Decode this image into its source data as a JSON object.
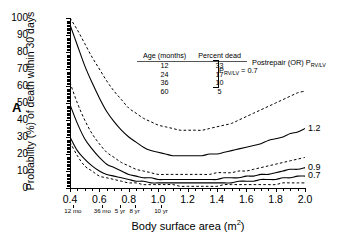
{
  "panel": {
    "letter": "A"
  },
  "axes": {
    "ylabel": "Probability (%) of death within 30 days",
    "xlabel_text": "Body surface area (m",
    "xlabel_sup": "2",
    "xlabel_tail": ")"
  },
  "legend": {
    "col1_header": "Age (months)",
    "col2_header": "Percent dead",
    "rows": [
      {
        "age": "12",
        "dead": "33"
      },
      {
        "age": "24",
        "dead": "17"
      },
      {
        "age": "36",
        "dead": "10"
      },
      {
        "age": "60",
        "dead": "5"
      }
    ],
    "brace_label_main": "P",
    "brace_label_sub": "RV/LV",
    "brace_label_value": " = 0.7",
    "postrepair_main": "Postrepair (OR) P",
    "postrepair_sub": "RV/LV"
  },
  "curve_labels": [
    {
      "text": "1.2"
    },
    {
      "text": "0.9"
    },
    {
      "text": "0.7"
    }
  ],
  "age_ticks": [
    {
      "label": "12 mo",
      "x": 0.42
    },
    {
      "label": "36 mo",
      "x": 0.62
    },
    {
      "label": "5 yr",
      "x": 0.74
    },
    {
      "label": "8 yr",
      "x": 0.84
    },
    {
      "label": "10 yr",
      "x": 1.02
    }
  ],
  "chart_data": {
    "type": "line",
    "title": "",
    "xlabel": "Body surface area (m2)",
    "ylabel": "Probability (%) of death within 30 days",
    "xlim": [
      0.4,
      2.0
    ],
    "ylim": [
      0,
      100
    ],
    "xticks": [
      0.4,
      0.6,
      0.8,
      1.0,
      1.2,
      1.4,
      1.6,
      1.8,
      2.0
    ],
    "yticks": [
      0,
      10,
      20,
      30,
      40,
      50,
      60,
      70,
      80,
      90,
      100
    ],
    "grid": false,
    "legend_position": "inside-top-center",
    "x": [
      0.4,
      0.45,
      0.5,
      0.55,
      0.6,
      0.65,
      0.7,
      0.75,
      0.8,
      0.85,
      0.9,
      0.95,
      1.0,
      1.05,
      1.1,
      1.15,
      1.2,
      1.25,
      1.3,
      1.35,
      1.4,
      1.45,
      1.5,
      1.55,
      1.6,
      1.65,
      1.7,
      1.75,
      1.8,
      1.85,
      1.9,
      1.95,
      2.0
    ],
    "series": [
      {
        "name": "PRV/LV 1.2 dashed",
        "style": "dashed",
        "end_label": "",
        "values": [
          100,
          93,
          85,
          77,
          70,
          63,
          57,
          52,
          47,
          44,
          41,
          39,
          37,
          36,
          35,
          34,
          34,
          34,
          34,
          35,
          36,
          37,
          38,
          40,
          42,
          44,
          46,
          48,
          50,
          52,
          54,
          56,
          57
        ]
      },
      {
        "name": "PRV/LV 1.2 solid",
        "style": "solid",
        "end_label": "1.2",
        "values": [
          96,
          84,
          72,
          62,
          53,
          45,
          39,
          34,
          30,
          27,
          24,
          22,
          21,
          20,
          19,
          19,
          19,
          19,
          19,
          20,
          20,
          21,
          22,
          23,
          24,
          25,
          26,
          28,
          29,
          30,
          32,
          33,
          35
        ]
      },
      {
        "name": "PRV/LV 0.9 dashed",
        "style": "dashed",
        "end_label": "",
        "values": [
          62,
          50,
          40,
          32,
          26,
          21,
          18,
          15,
          13,
          11,
          10,
          9,
          8,
          8,
          8,
          8,
          8,
          8,
          8,
          8,
          9,
          9,
          9,
          10,
          10,
          11,
          12,
          13,
          14,
          15,
          16,
          17,
          18
        ]
      },
      {
        "name": "PRV/LV 0.9 solid",
        "style": "solid",
        "end_label": "0.9",
        "values": [
          49,
          38,
          29,
          23,
          18,
          14,
          12,
          10,
          8,
          7,
          6,
          6,
          5,
          5,
          5,
          5,
          5,
          5,
          5,
          5,
          5,
          6,
          6,
          6,
          7,
          7,
          8,
          8,
          9,
          10,
          11,
          11,
          12
        ]
      },
      {
        "name": "PRV/LV 0.7 solid",
        "style": "solid",
        "end_label": "0.7",
        "values": [
          30,
          22,
          17,
          13,
          10,
          8,
          7,
          6,
          5,
          4,
          4,
          3,
          3,
          3,
          3,
          3,
          3,
          3,
          3,
          3,
          3,
          3,
          3,
          4,
          4,
          4,
          5,
          5,
          5,
          6,
          6,
          7,
          7
        ]
      },
      {
        "name": "PRV/LV 0.7 dashed",
        "style": "dashed",
        "end_label": "",
        "values": [
          27,
          19,
          13,
          10,
          7,
          6,
          5,
          4,
          3,
          3,
          2,
          2,
          2,
          2,
          2,
          1,
          1,
          1,
          1,
          1,
          1,
          2,
          2,
          2,
          2,
          2,
          2,
          2,
          2,
          3,
          3,
          3,
          3
        ]
      }
    ]
  }
}
